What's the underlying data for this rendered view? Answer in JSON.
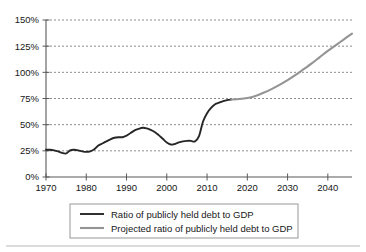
{
  "chart_data": {
    "type": "line",
    "title": "",
    "subtitle": "",
    "xlabel": "",
    "ylabel": "",
    "xlim": [
      1970,
      2046
    ],
    "ylim": [
      0,
      150
    ],
    "grid": true,
    "legend_position": "bottom",
    "y_ticks": [
      "0%",
      "25%",
      "50%",
      "75%",
      "100%",
      "125%",
      "150%"
    ],
    "y_tick_values": [
      0,
      25,
      50,
      75,
      100,
      125,
      150
    ],
    "x_ticks": [
      "1970",
      "1980",
      "1990",
      "2000",
      "2010",
      "2020",
      "2030",
      "2040"
    ],
    "x_tick_values": [
      1970,
      1980,
      1990,
      2000,
      2010,
      2020,
      2030,
      2040
    ],
    "series": [
      {
        "name": "Ratio of publicly held debt to GDP",
        "color": "#262626",
        "style": "solid",
        "x": [
          1970,
          1971,
          1972,
          1973,
          1974,
          1975,
          1976,
          1977,
          1978,
          1979,
          1980,
          1981,
          1982,
          1983,
          1984,
          1985,
          1986,
          1987,
          1988,
          1989,
          1990,
          1991,
          1992,
          1993,
          1994,
          1995,
          1996,
          1997,
          1998,
          1999,
          2000,
          2001,
          2002,
          2003,
          2004,
          2005,
          2006,
          2007,
          2008,
          2009,
          2010,
          2011,
          2012,
          2013,
          2014,
          2015,
          2016
        ],
        "values": [
          26,
          26,
          25.5,
          24.5,
          23,
          22.5,
          25.5,
          26,
          25.5,
          24.5,
          24,
          24.5,
          26.5,
          30,
          32,
          34,
          36,
          37.5,
          38,
          38,
          39.5,
          42,
          44.5,
          46,
          47,
          46.5,
          45,
          43,
          40,
          36.5,
          33,
          31,
          31.5,
          33,
          34,
          34.5,
          34.5,
          34,
          39,
          53,
          61,
          66,
          69.5,
          71,
          72.5,
          73.5,
          74
        ]
      },
      {
        "name": "Projected ratio of publicly held debt to GDP",
        "color": "#949494",
        "style": "solid",
        "x": [
          2016,
          2018,
          2020,
          2022,
          2024,
          2026,
          2028,
          2030,
          2032,
          2034,
          2036,
          2038,
          2040,
          2042,
          2044,
          2046
        ],
        "values": [
          74,
          74.5,
          75.5,
          77.5,
          80.5,
          84,
          88,
          92.5,
          97.5,
          103,
          108.5,
          114.5,
          120.5,
          126,
          131.5,
          137
        ]
      }
    ]
  },
  "legend": {
    "items": [
      {
        "label": "Ratio of publicly held debt to GDP",
        "color": "#262626"
      },
      {
        "label": "Projected ratio of publicly held debt to GDP",
        "color": "#949494"
      }
    ]
  }
}
